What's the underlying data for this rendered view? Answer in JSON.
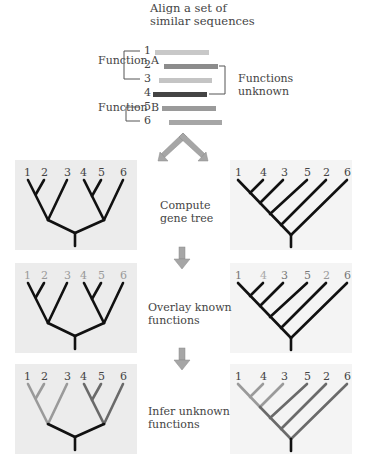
{
  "header": {
    "title_line1": "Align a set of",
    "title_line2": "similar sequences"
  },
  "alignment": {
    "function_a_label": "Function A",
    "function_b_label": "Function B",
    "unknown_line1": "Functions",
    "unknown_line2": "unknown",
    "sequences": [
      {
        "id": "1",
        "color": "#c8c8c8"
      },
      {
        "id": "2",
        "color": "#8c8c8c"
      },
      {
        "id": "3",
        "color": "#c4c4c4"
      },
      {
        "id": "4",
        "color": "#444444"
      },
      {
        "id": "5",
        "color": "#9a9a9a"
      },
      {
        "id": "6",
        "color": "#a6a6a6"
      }
    ]
  },
  "steps": {
    "compute_line1": "Compute",
    "compute_line2": "gene tree",
    "overlay_line1": "Overlay known",
    "overlay_line2": "functions",
    "infer_line1": "Infer unknown",
    "infer_line2": "functions"
  },
  "trees": {
    "left_leaf_order": [
      "1",
      "2",
      "3",
      "4",
      "5",
      "6"
    ],
    "right_leaf_order": [
      "1",
      "4",
      "3",
      "5",
      "2",
      "6"
    ]
  },
  "colors": {
    "branch_default": "#111111",
    "function_a": "#9a9a9a",
    "function_b": "#6a6a6a",
    "known_label": "#999999",
    "unknown_label": "#333333",
    "arrow": "#a0a0a0"
  }
}
